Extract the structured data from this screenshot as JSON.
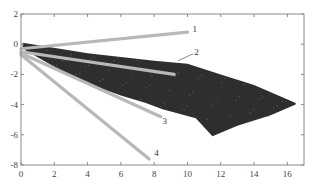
{
  "chart_data": {
    "type": "line",
    "title": "",
    "xlabel": "",
    "ylabel": "",
    "xlim": [
      0,
      17
    ],
    "ylim": [
      -8,
      2
    ],
    "x_ticks": [
      0,
      2,
      4,
      6,
      8,
      10,
      12,
      14,
      16
    ],
    "y_ticks": [
      2,
      0,
      -2,
      -4,
      -6,
      -8
    ],
    "x_tick_labels": [
      "0",
      "2",
      "4",
      "6",
      "8",
      "10",
      "12",
      "14",
      "16"
    ],
    "y_tick_labels": [
      "2",
      "0",
      "-2",
      "-4",
      "-6",
      "-8"
    ],
    "grid": false,
    "legend": "none",
    "series": [
      {
        "name": "1",
        "label": "1",
        "x": [
          0,
          10
        ],
        "y": [
          -0.3,
          0.8
        ],
        "color": "#b8b8b8"
      },
      {
        "name": "2",
        "label": "2",
        "x": [
          0,
          9.2
        ],
        "y": [
          -0.5,
          -2.0
        ],
        "color": "#b8b8b8"
      },
      {
        "name": "3",
        "label": "3",
        "x": [
          0,
          8.4
        ],
        "y": [
          -0.6,
          -4.8
        ],
        "color": "#b8b8b8"
      },
      {
        "name": "4",
        "label": "4",
        "x": [
          0,
          7.7
        ],
        "y": [
          -0.7,
          -7.6
        ],
        "color": "#b8b8b8"
      }
    ],
    "region": {
      "name": "dense trajectory region",
      "color": "#2e2e2e",
      "upper_edge": {
        "x": [
          0.1,
          4,
          8,
          10,
          12,
          14,
          16.5
        ],
        "y": [
          0.1,
          -0.6,
          -1.1,
          -1.3,
          -2.0,
          -2.7,
          -3.9
        ]
      },
      "lower_edge": {
        "x": [
          0.1,
          2,
          4,
          6,
          7.5,
          8.5,
          9.5,
          10.5,
          11.5,
          13,
          15,
          16.5
        ],
        "y": [
          -0.3,
          -1.5,
          -2.6,
          -3.4,
          -3.9,
          -4.3,
          -4.6,
          -4.9,
          -6.1,
          -5.4,
          -4.7,
          -4.0
        ]
      }
    },
    "annotations": [
      {
        "text": "1",
        "x": 10.3,
        "y": 1.0
      },
      {
        "text": "2",
        "x": 10.4,
        "y": -0.5
      },
      {
        "text": "3",
        "x": 8.5,
        "y": -5.1
      },
      {
        "text": "4",
        "x": 8.0,
        "y": -7.2
      }
    ],
    "colors": {
      "axis": "#888888",
      "lines": "#b8b8b8",
      "region": "#2e2e2e",
      "background": "#ffffff"
    }
  }
}
